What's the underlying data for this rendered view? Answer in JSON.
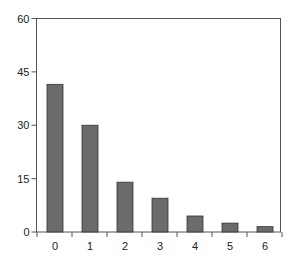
{
  "chart_data": {
    "type": "bar",
    "title": "",
    "xlabel": "",
    "ylabel": "",
    "categories": [
      "0",
      "1",
      "2",
      "3",
      "4",
      "5",
      "6"
    ],
    "values": [
      41.5,
      30,
      14,
      9.5,
      4.5,
      2.5,
      1.5
    ],
    "ylim": [
      0,
      60
    ],
    "yticks": [
      0,
      15,
      30,
      45,
      60
    ],
    "grid": false,
    "legend": null,
    "bar_color": "#6b6b6b",
    "bar_edge_color": "#333333"
  }
}
